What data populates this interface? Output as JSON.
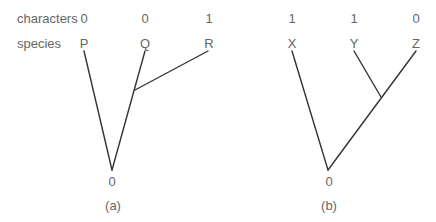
{
  "row_labels": {
    "characters": "characters",
    "species": "species"
  },
  "tree_a": {
    "caption": "(a)",
    "characters": [
      "0",
      "0",
      "1"
    ],
    "species": [
      "P",
      "Q",
      "R"
    ],
    "root_state": "0"
  },
  "tree_b": {
    "caption": "(b)",
    "characters": [
      "1",
      "1",
      "0"
    ],
    "species": [
      "X",
      "Y",
      "Z"
    ],
    "root_state": "0"
  }
}
